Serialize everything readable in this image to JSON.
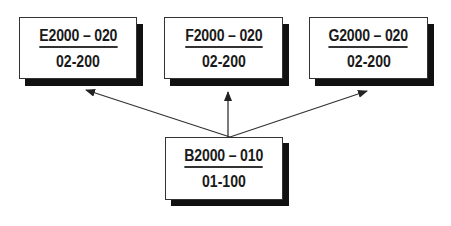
{
  "diagram": {
    "type": "hierarchy",
    "nodes": [
      {
        "id": "E",
        "code": "E2000 – 020",
        "sub": "02-200",
        "role": "child"
      },
      {
        "id": "F",
        "code": "F2000 – 020",
        "sub": "02-200",
        "role": "child"
      },
      {
        "id": "G",
        "code": "G2000 – 020",
        "sub": "02-200",
        "role": "child"
      },
      {
        "id": "B",
        "code": "B2000 – 010",
        "sub": "01-100",
        "role": "source"
      }
    ],
    "edges": [
      {
        "from": "B",
        "to": "E"
      },
      {
        "from": "B",
        "to": "F"
      },
      {
        "from": "B",
        "to": "G"
      }
    ],
    "colors": {
      "box_fill": "#ffffff",
      "border": "#333333",
      "shadow": "#111111",
      "text": "#1a1a1a"
    }
  }
}
